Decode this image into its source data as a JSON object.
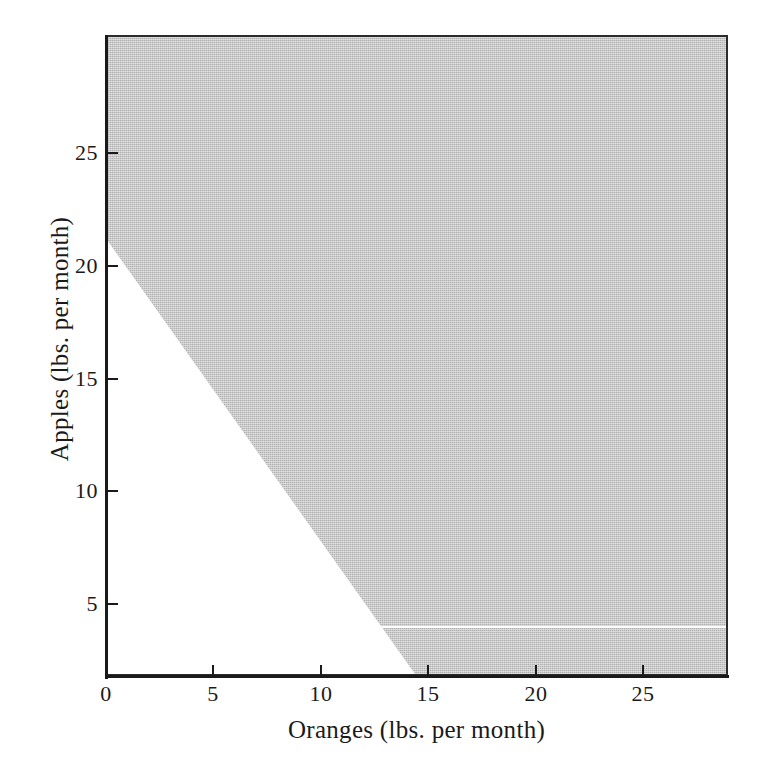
{
  "figure": {
    "title": "",
    "background_color": "#ffffff",
    "foreground_color": "#1a1a1a"
  },
  "axes": {
    "x": {
      "label": "Oranges (lbs. per month)",
      "ticks": [
        "0",
        "5",
        "10",
        "15",
        "20",
        "25"
      ]
    },
    "y": {
      "label": "Apples (lbs. per month)",
      "ticks": [
        "5",
        "10",
        "15",
        "20",
        "25"
      ]
    }
  },
  "region": {
    "name": "shaded-region",
    "fill_color": "#b2b2b2",
    "description": "shaded area above and to the right of the budget line"
  },
  "chart_data": {
    "type": "area",
    "title": "",
    "subtitle": "",
    "xlabel": "Oranges (lbs. per month)",
    "ylabel": "Apples (lbs. per month)",
    "xlim": [
      0,
      29.0
    ],
    "ylim": [
      0,
      29.2
    ],
    "xticks": [
      0,
      5,
      10,
      15,
      20,
      25
    ],
    "yticks": [
      5,
      10,
      15,
      20,
      25
    ],
    "grid": false,
    "legend": null,
    "series": [
      {
        "name": "Budget line (boundary of shaded set)",
        "type": "line",
        "color": "#b2b2b2",
        "x": [
          0,
          14.5
        ],
        "y": [
          20,
          0
        ],
        "x_intercept": 14.5,
        "y_intercept": 20,
        "slope": -1.379
      },
      {
        "name": "Shaded region",
        "type": "area",
        "color": "#b2b2b2",
        "fill": "above-and-right-of-line",
        "polygon_x": [
          0,
          14.5,
          29.0,
          29.0,
          0
        ],
        "polygon_y": [
          20,
          0,
          0,
          29.2,
          29.2
        ]
      }
    ],
    "annotations": [
      {
        "name": "scan-artifact-line",
        "type": "horizontal-line",
        "y": 2.3,
        "color": "#fdfdfd",
        "note": "thin white horizontal scanning artifact across the shaded area"
      }
    ]
  }
}
